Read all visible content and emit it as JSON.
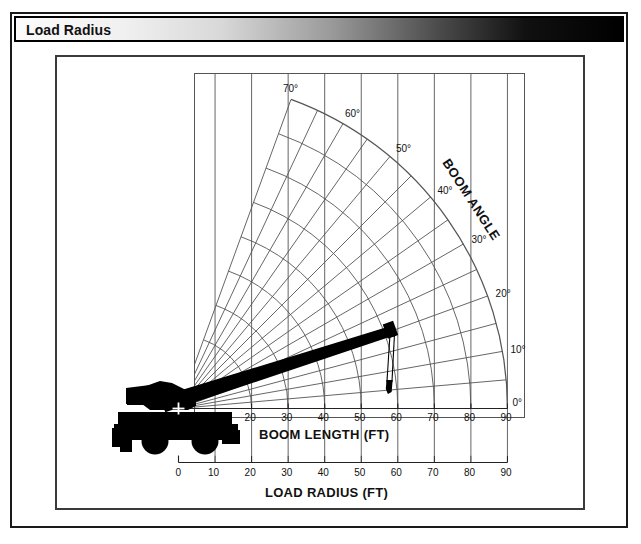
{
  "window": {
    "title": "Load Radius"
  },
  "chart_data": {
    "type": "line",
    "title": "Load Radius",
    "xlabel": "LOAD RADIUS (FT)",
    "ylabel": "",
    "secondary_axis_label": "BOOM LENGTH (FT)",
    "radial_axis_label": "BOOM ANGLE",
    "grid": true,
    "legend": "none",
    "load_radius_axis": {
      "label": "LOAD RADIUS (FT)",
      "ticks": [
        0,
        10,
        20,
        30,
        40,
        50,
        60,
        70,
        80,
        90
      ],
      "min": 0,
      "max": 90,
      "units": "FT"
    },
    "boom_length_axis": {
      "label": "BOOM LENGTH (FT)",
      "ticks": [
        20,
        30,
        40,
        50,
        60,
        70,
        80,
        90
      ],
      "min": 0,
      "max": 90,
      "units": "FT"
    },
    "boom_angle_axis": {
      "label": "BOOM ANGLE",
      "labeled_ticks": [
        0,
        10,
        20,
        30,
        40,
        50,
        60,
        70
      ],
      "minor_step": 5,
      "min": 0,
      "max": 70,
      "units": "degrees",
      "degree_symbol": "°"
    },
    "angle_tick_labels": [
      "0°",
      "10°",
      "20°",
      "30°",
      "40°",
      "50°",
      "60°",
      "70°"
    ],
    "load_radius_tick_labels": [
      "0",
      "10",
      "20",
      "30",
      "40",
      "50",
      "60",
      "70",
      "80",
      "90"
    ],
    "boom_length_tick_labels": [
      "20",
      "30",
      "40",
      "50",
      "60",
      "70",
      "80",
      "90"
    ],
    "crane": {
      "name": "rough-terrain-crane",
      "pivot_marker": "+",
      "boom_angle_deg": 20,
      "boom_length_ft": 62,
      "load_radius_ft": 58,
      "description": "Rough terrain crane with telescopic boom extended at approximately 20 degrees"
    },
    "colors": {
      "grid": "#555555",
      "axis": "#222222",
      "crane": "#000000",
      "background": "#ffffff",
      "frame": "#1a1a1a"
    }
  },
  "labels": {
    "load_radius_axis_title": "LOAD RADIUS (FT)",
    "boom_length_axis_title": "BOOM LENGTH (FT)",
    "boom_angle_title": "BOOM ANGLE"
  }
}
